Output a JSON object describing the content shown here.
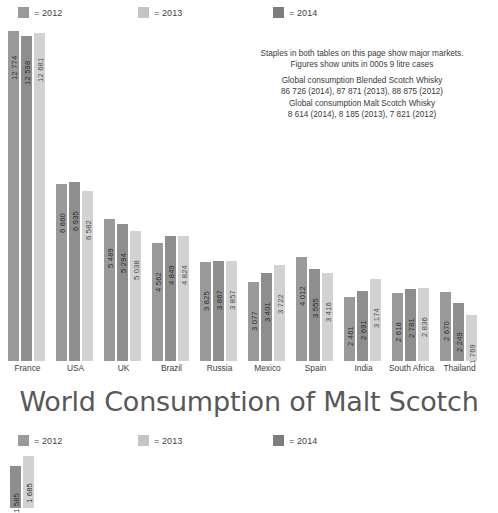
{
  "legend": {
    "items": [
      {
        "label": "= 2012",
        "color": "#9a9a9a",
        "name": "legend-swatch-2012"
      },
      {
        "label": "= 2013",
        "color": "#c4c4c4",
        "name": "legend-swatch-2013"
      },
      {
        "label": "= 2014",
        "color": "#7d7d7d",
        "name": "legend-swatch-2014"
      }
    ],
    "positions": [
      18,
      138,
      273
    ]
  },
  "note": {
    "line1": "Staples in both tables on this page show major markets.",
    "line2": "Figures show units in 000s 9 litre cases",
    "line3": "Global consumption Blended Scotch Whisky",
    "line4": "86 726 (2014), 87 871 (2013), 88 875 (2012)",
    "line5": "Global consumption Malt Scotch Whisky",
    "line6": "8 614 (2014), 8 185 (2013), 7 821 (2012)"
  },
  "title": "World Consumption of Malt Scotch",
  "chart_data": {
    "type": "bar",
    "title": "World Consumption of Malt Scotch",
    "xlabel": "",
    "ylabel": "000s 9 litre cases",
    "ylim": [
      0,
      13500
    ],
    "grid": false,
    "legend_position": "top",
    "categories": [
      "France",
      "USA",
      "UK",
      "Brazil",
      "Russia",
      "Mexico",
      "Spain",
      "India",
      "South Africa",
      "Thailand"
    ],
    "series": [
      {
        "name": "2012",
        "color": "#9a9a9a",
        "values": [
          12774,
          6860,
          5489,
          4562,
          3825,
          3077,
          4012,
          2461,
          2618,
          2670
        ],
        "labels": [
          "12 774",
          "6 860",
          "5 489",
          "4 562",
          "3 825",
          "3 077",
          "4 012",
          "2 461",
          "2 618",
          "2 670"
        ]
      },
      {
        "name": "2013",
        "color": "#8e8e8e",
        "values": [
          12598,
          6935,
          5294,
          4849,
          3867,
          3401,
          3555,
          2691,
          2781,
          2249
        ],
        "labels": [
          "12 598",
          "6 935",
          "5 294",
          "4 849",
          "3 867",
          "3 401",
          "3 555",
          "2 691",
          "2 781",
          "2 249"
        ]
      },
      {
        "name": "2014",
        "color": "#d2d2d2",
        "values": [
          12681,
          6582,
          5038,
          4824,
          3857,
          3722,
          3416,
          3174,
          2836,
          1769
        ],
        "labels": [
          "12 681",
          "6 582",
          "5 038",
          "4 824",
          "3 857",
          "3 722",
          "3 416",
          "3 174",
          "2 836",
          "1 769"
        ]
      }
    ]
  },
  "bottom_chart": {
    "legend": {
      "items": [
        {
          "label": "= 2012",
          "color": "#9a9a9a"
        },
        {
          "label": "= 2013",
          "color": "#c4c4c4"
        },
        {
          "label": "= 2014",
          "color": "#7d7d7d"
        }
      ],
      "positions": [
        18,
        138,
        273
      ]
    },
    "bars": [
      {
        "label": "1 585",
        "value": 1585,
        "color": "#8e8e8e",
        "height": 42
      },
      {
        "label": "1 685",
        "value": 1685,
        "color": "#d2d2d2",
        "height": 52
      }
    ]
  },
  "layout": {
    "group_left": [
      8,
      56,
      104,
      152,
      200,
      248,
      296,
      344,
      392,
      440
    ],
    "group_width": 39,
    "plot_height": 335,
    "max_value": 12774,
    "max_pixel": 330
  }
}
